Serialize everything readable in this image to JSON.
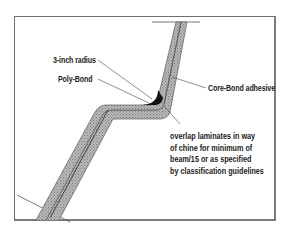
{
  "diagram": {
    "type": "laminate chine cross-section",
    "labels": {
      "radius": "3-inch radius",
      "poly_bond": "Poly-Bond",
      "core_bond": "Core-Bond adhesive"
    },
    "note_lines": [
      "overlap laminates in way",
      "of chine for minimum of",
      "beam/15 or as specified",
      "by classification guidelines"
    ],
    "colors": {
      "laminate_fill": "#a9a9a9",
      "laminate_edge": "#5a5a5a",
      "fillet": "#111111",
      "frame": "#6f6f6f",
      "leader": "#444444"
    }
  }
}
